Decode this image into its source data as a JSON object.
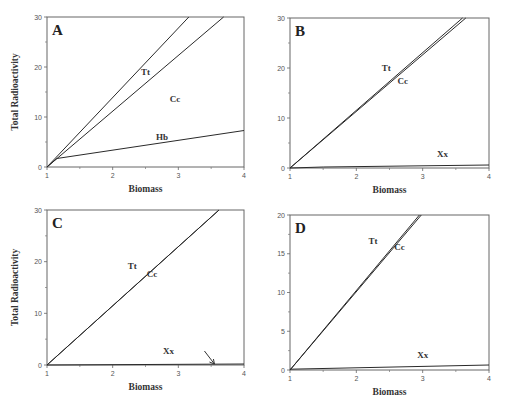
{
  "figure": {
    "xlabel": "Biomass",
    "ylabel": "Total Radioactivity"
  },
  "chart_data": [
    {
      "type": "line",
      "panel": "A",
      "title": "A",
      "xlabel": "Biomass",
      "ylabel": "Total Radioactivity",
      "xlim": [
        1,
        4
      ],
      "ylim": [
        0,
        30
      ],
      "xticks": [
        1,
        2,
        3,
        4
      ],
      "yticks": [
        0,
        10,
        20,
        30
      ],
      "grid": false,
      "series": [
        {
          "name": "(upper, unlabeled)",
          "x": [
            1,
            3.16
          ],
          "y": [
            0,
            30
          ]
        },
        {
          "name": "Tt",
          "x": [
            1,
            3.69
          ],
          "y": [
            0,
            30
          ]
        },
        {
          "name": "Hb",
          "x": [
            1,
            1.15,
            4
          ],
          "y": [
            0,
            1.7,
            7.3
          ]
        }
      ],
      "annotations": [
        {
          "text": "Tt",
          "x": 2.5,
          "y": 18.5
        },
        {
          "text": "Cc",
          "x": 2.95,
          "y": 13
        },
        {
          "text": "Hb",
          "x": 2.75,
          "y": 5.5
        }
      ]
    },
    {
      "type": "line",
      "panel": "B",
      "title": "B",
      "xlabel": "Biomass",
      "ylabel": "",
      "xlim": [
        1,
        4
      ],
      "ylim": [
        0,
        30
      ],
      "xticks": [
        1,
        2,
        3,
        4
      ],
      "yticks": [
        0,
        10,
        20,
        30
      ],
      "grid": false,
      "series": [
        {
          "name": "Tt",
          "x": [
            1,
            3.6
          ],
          "y": [
            0,
            30
          ]
        },
        {
          "name": "Cc",
          "x": [
            1,
            3.65
          ],
          "y": [
            0,
            30
          ]
        },
        {
          "name": "Xx",
          "x": [
            1,
            1.5,
            4
          ],
          "y": [
            0,
            0.2,
            0.6
          ]
        }
      ],
      "annotations": [
        {
          "text": "Tt",
          "x": 2.45,
          "y": 19.5
        },
        {
          "text": "Cc",
          "x": 2.7,
          "y": 16.8
        },
        {
          "text": "Xx",
          "x": 3.3,
          "y": 2.2
        }
      ]
    },
    {
      "type": "line",
      "panel": "C",
      "title": "C",
      "xlabel": "Biomass",
      "ylabel": "Total Radioactivity",
      "xlim": [
        1,
        4
      ],
      "ylim": [
        0,
        30
      ],
      "xticks": [
        1,
        2,
        3,
        4
      ],
      "yticks": [
        0,
        10,
        20,
        30
      ],
      "grid": false,
      "series": [
        {
          "name": "Tt",
          "x": [
            1,
            3.62
          ],
          "y": [
            0,
            30
          ]
        },
        {
          "name": "Cc",
          "x": [
            1,
            3.62
          ],
          "y": [
            0,
            30
          ]
        },
        {
          "name": "Xx",
          "x": [
            1,
            4
          ],
          "y": [
            0,
            0.2
          ]
        }
      ],
      "annotations": [
        {
          "text": "Tt",
          "x": 2.3,
          "y": 18.5
        },
        {
          "text": "Cc",
          "x": 2.6,
          "y": 17
        },
        {
          "text": "Xx",
          "x": 2.85,
          "y": 2.2
        },
        {
          "text": "arrow",
          "x": 3.55,
          "y": 0
        }
      ]
    },
    {
      "type": "line",
      "panel": "D",
      "title": "D",
      "xlabel": "Biomass",
      "ylabel": "",
      "xlim": [
        1,
        4
      ],
      "ylim": [
        0,
        20
      ],
      "xticks": [
        1,
        2,
        3,
        4
      ],
      "yticks": [
        0,
        5,
        10,
        15,
        20
      ],
      "grid": false,
      "series": [
        {
          "name": "Tt",
          "x": [
            1,
            2.95
          ],
          "y": [
            0,
            20
          ]
        },
        {
          "name": "Cc",
          "x": [
            1,
            2.98
          ],
          "y": [
            0,
            20
          ]
        },
        {
          "name": "Xx",
          "x": [
            1,
            4
          ],
          "y": [
            0.1,
            0.65
          ]
        }
      ],
      "annotations": [
        {
          "text": "Tt",
          "x": 2.25,
          "y": 16.2
        },
        {
          "text": "Cc",
          "x": 2.65,
          "y": 15.5
        },
        {
          "text": "Xx",
          "x": 3.0,
          "y": 1.5
        }
      ]
    }
  ]
}
